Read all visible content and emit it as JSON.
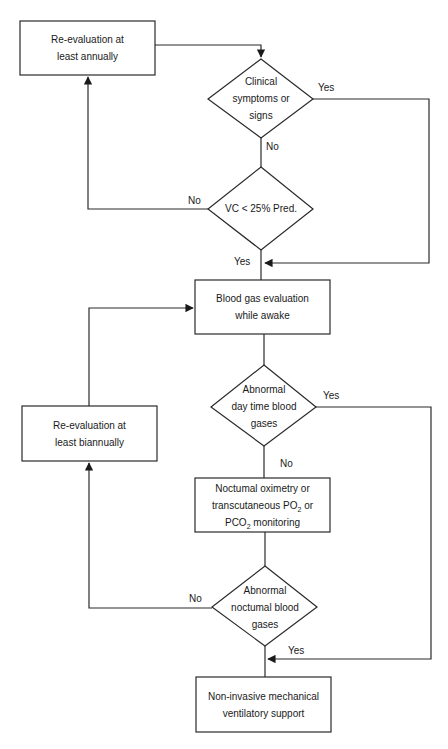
{
  "diagram": {
    "type": "flowchart",
    "nodes": {
      "reeval_annual": {
        "shape": "rect",
        "line1": "Re-evaluation at",
        "line2": "least annually"
      },
      "clinical": {
        "shape": "diamond",
        "line1": "Clinical",
        "line2": "symptoms or",
        "line3": "signs"
      },
      "vc": {
        "shape": "diamond",
        "line1": "VC <  25% Pred."
      },
      "blood_gas": {
        "shape": "rect",
        "line1": "Blood gas evaluation",
        "line2": "while awake"
      },
      "abn_day": {
        "shape": "diamond",
        "line1": "Abnormal",
        "line2": "day time blood",
        "line3": "gases"
      },
      "reeval_biannual": {
        "shape": "rect",
        "line1": "Re-evaluation at",
        "line2": "least biannually"
      },
      "nocturnal_mon": {
        "shape": "rect",
        "line1": "Noctumal oximetry or",
        "line2_pre": "transcutaneous PO",
        "line2_sub": "2",
        "line2_post": " or",
        "line3_pre": "PCO",
        "line3_sub": "2",
        "line3_post": " monitoring"
      },
      "abn_night": {
        "shape": "diamond",
        "line1": "Abnormal",
        "line2": "noctumal blood",
        "line3": "gases"
      },
      "niv": {
        "shape": "rect",
        "line1": "Non-invasive mechanical",
        "line2": "ventilatory support"
      }
    },
    "edge_labels": {
      "clinical_yes": "Yes",
      "clinical_no": "No",
      "vc_no": "No",
      "vc_yes": "Yes",
      "day_yes": "Yes",
      "day_no": "No",
      "night_no": "No",
      "night_yes": "Yes"
    },
    "edges": [
      {
        "from": "reeval_annual",
        "to": "clinical"
      },
      {
        "from": "clinical",
        "to": "blood_gas",
        "label": "Yes"
      },
      {
        "from": "clinical",
        "to": "vc",
        "label": "No"
      },
      {
        "from": "vc",
        "to": "reeval_annual",
        "label": "No"
      },
      {
        "from": "vc",
        "to": "blood_gas",
        "label": "Yes"
      },
      {
        "from": "blood_gas",
        "to": "abn_day"
      },
      {
        "from": "abn_day",
        "to": "niv",
        "label": "Yes"
      },
      {
        "from": "abn_day",
        "to": "nocturnal_mon",
        "label": "No"
      },
      {
        "from": "nocturnal_mon",
        "to": "abn_night"
      },
      {
        "from": "abn_night",
        "to": "reeval_biannual",
        "label": "No"
      },
      {
        "from": "abn_night",
        "to": "niv",
        "label": "Yes"
      },
      {
        "from": "reeval_biannual",
        "to": "blood_gas"
      }
    ],
    "colors": {
      "line": "#2a2a2a",
      "text": "#1a1a1a",
      "background": "#ffffff"
    }
  }
}
